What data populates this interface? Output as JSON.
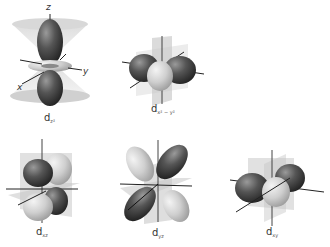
{
  "colors": {
    "dark_lobe": "#4a4a4a",
    "light_lobe": "#cfcfcf",
    "plane": "#bdbdbd",
    "axis": "#222222",
    "label": "#333333"
  },
  "orbitals": [
    {
      "id": "dz2",
      "base": "d",
      "subscript": "z²",
      "axes": {
        "z": "z",
        "x": "x",
        "y": "y"
      }
    },
    {
      "id": "dx2-y2",
      "base": "d",
      "subscript": "x² − y²"
    },
    {
      "id": "dxz",
      "base": "d",
      "subscript": "xz"
    },
    {
      "id": "dyz",
      "base": "d",
      "subscript": "yz"
    },
    {
      "id": "dxy",
      "base": "d",
      "subscript": "xy"
    }
  ]
}
